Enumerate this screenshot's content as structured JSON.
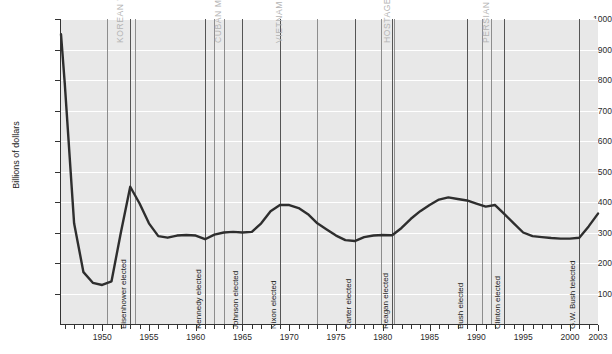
{
  "chart_data": {
    "type": "line",
    "title": "",
    "xlabel": "",
    "ylabel": "Billions of dollars",
    "ylim": [
      0,
      1000
    ],
    "xlim": [
      1945.6,
      2003
    ],
    "grid": true,
    "legend": "none",
    "y_ticks": [
      100,
      200,
      300,
      400,
      500,
      600,
      700,
      800,
      900,
      1000
    ],
    "x_ticks": [
      1950,
      1955,
      1960,
      1965,
      1970,
      1975,
      1980,
      1985,
      1990,
      1995,
      2000,
      2003
    ],
    "x_tick_interval_minor": 1,
    "series": [
      {
        "name": "Defense spending",
        "x": [
          1945.6,
          1946,
          1947,
          1948,
          1949,
          1950,
          1951,
          1952,
          1953,
          1954,
          1955,
          1956,
          1957,
          1958,
          1959,
          1960,
          1961,
          1962,
          1963,
          1964,
          1965,
          1966,
          1967,
          1968,
          1969,
          1970,
          1971,
          1972,
          1973,
          1974,
          1975,
          1976,
          1977,
          1978,
          1979,
          1980,
          1981,
          1982,
          1983,
          1984,
          1985,
          1986,
          1987,
          1988,
          1989,
          1990,
          1991,
          1992,
          1993,
          1994,
          1995,
          1996,
          1997,
          1998,
          1999,
          2000,
          2001,
          2002,
          2003
        ],
        "values": [
          950,
          790,
          330,
          170,
          135,
          128,
          140,
          300,
          450,
          395,
          330,
          288,
          283,
          290,
          292,
          290,
          278,
          293,
          300,
          302,
          300,
          302,
          330,
          370,
          390,
          390,
          380,
          360,
          330,
          310,
          290,
          275,
          272,
          285,
          290,
          292,
          291,
          315,
          345,
          370,
          390,
          408,
          415,
          410,
          405,
          395,
          385,
          390,
          360,
          330,
          300,
          288,
          285,
          282,
          280,
          280,
          283,
          320,
          362
        ]
      }
    ],
    "annotations": {
      "wars": [
        {
          "label": "KOREAN WAR",
          "start": 1950.5,
          "end": 1953.5
        },
        {
          "label": "CUBAN MISSILE CRISIS",
          "start": 1962.0,
          "end": 1963.0
        },
        {
          "label": "VIETNAM WAR",
          "start": 1965.0,
          "end": 1973.0
        },
        {
          "label": "HOSTAGES IN IRAN",
          "start": 1979.8,
          "end": 1981.2
        },
        {
          "label": "PERSIAN GULF WAR",
          "start": 1990.6,
          "end": 1991.6
        }
      ],
      "elections": [
        {
          "label": "Eisenhower elected",
          "year": 1953
        },
        {
          "label": "Kennedy elected",
          "year": 1961
        },
        {
          "label": "Johnson elected",
          "year": 1965
        },
        {
          "label": "Nixon elected",
          "year": 1969
        },
        {
          "label": "Carter elected",
          "year": 1977
        },
        {
          "label": "Reagan elected",
          "year": 1981
        },
        {
          "label": "Bush elected",
          "year": 1989
        },
        {
          "label": "Clinton elected",
          "year": 1993
        },
        {
          "label": "G.W. Bush telected",
          "year": 2001
        }
      ]
    },
    "colors": {
      "plot_background": "#e8e8e8",
      "gridline": "#ffffff",
      "series_line": "#2e2e2e",
      "event_line": "#555555",
      "war_label": "#b4b4b4",
      "election_label": "#1a1a1a",
      "axis": "#333333"
    }
  }
}
